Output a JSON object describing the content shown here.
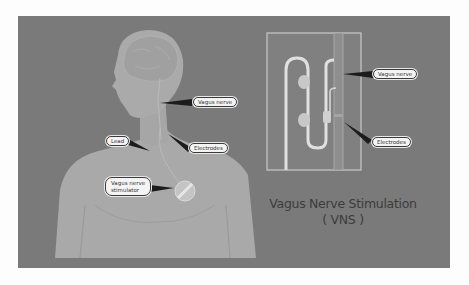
{
  "diagram": {
    "title": "Vagus Nerve Stimulation",
    "subtitle": "( VNS )",
    "colors": {
      "background": "#7a7a7a",
      "body": "#a8a8a8",
      "inset_border": "#c8c8c8",
      "label_fill": "#f4f4f4"
    },
    "body_labels": {
      "vagus_nerve": "Vagus nerve",
      "lead": "Lead",
      "electrodes": "Electrodes",
      "stimulator_line1": "Vagus nerve",
      "stimulator_line2": "stimulator"
    },
    "inset_labels": {
      "vagus_nerve": "Vagus nerve",
      "electrodes": "Electrodes"
    }
  }
}
